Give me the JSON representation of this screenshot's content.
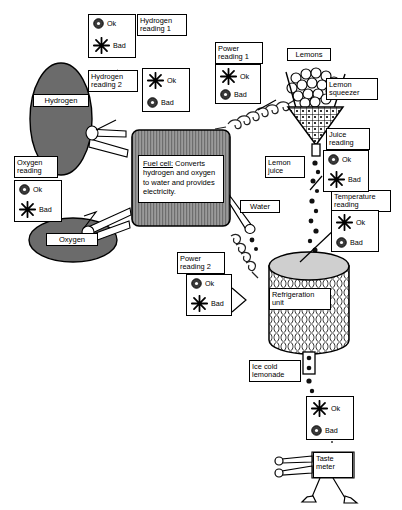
{
  "diagram": {
    "colors": {
      "gas_tank_fill": "#6b6b6b",
      "fuel_cell_fill": "#8c8c8c",
      "stroke": "#000000",
      "background": "#ffffff",
      "fridge_fill": "#cfcfcf"
    },
    "components": [
      {
        "id": "hydrogen-tank",
        "label": "Hydrogen",
        "kind": "ellipse-tank"
      },
      {
        "id": "oxygen-tank",
        "label": "Oxygen",
        "kind": "ellipse-tank"
      },
      {
        "id": "fuel-cell",
        "label": "Fuel cell:",
        "kind": "box"
      },
      {
        "id": "lemons",
        "label": "Lemons",
        "kind": "pile"
      },
      {
        "id": "lemon-squeezer",
        "label": "Lemon\nsqueezer",
        "kind": "funnel"
      },
      {
        "id": "lemon-juice",
        "label": "Lemon\njuice",
        "kind": "drip"
      },
      {
        "id": "water",
        "label": "Water",
        "kind": "pipe"
      },
      {
        "id": "refrigeration-unit",
        "label": "Refrigeration\nunit",
        "kind": "cylinder"
      },
      {
        "id": "ice-cold-lemonade",
        "label": "Ice cold\nlemonade",
        "kind": "drip"
      },
      {
        "id": "taste-meter",
        "label": "Taste\nmeter",
        "kind": "figure"
      }
    ],
    "fuel_cell": {
      "title": "Fuel cell:",
      "description": "Converts hydrogen and oxygen to water and provides electricity."
    },
    "gauges": [
      {
        "id": "hydrogen-reading-1",
        "title": "Hydrogen\nreading 1",
        "ok_symbol": "circle",
        "ok_label": "Ok",
        "bad_symbol": "starburst",
        "bad_label": "Bad",
        "top_symbol": "circle"
      },
      {
        "id": "hydrogen-reading-2",
        "title": "Hydrogen\nreading 2",
        "ok_symbol": "starburst",
        "ok_label": "Ok",
        "bad_symbol": "circle",
        "bad_label": "Bad",
        "top_symbol": "starburst"
      },
      {
        "id": "oxygen-reading",
        "title": "Oxygen\nreading",
        "ok_symbol": "circle",
        "ok_label": "Ok",
        "bad_symbol": "starburst",
        "bad_label": "Bad",
        "top_symbol": "circle"
      },
      {
        "id": "power-reading-1",
        "title": "Power\nreading  1",
        "ok_symbol": "starburst",
        "ok_label": "Ok",
        "bad_symbol": "circle",
        "bad_label": "Bad",
        "top_symbol": "starburst"
      },
      {
        "id": "power-reading-2",
        "title": "Power\nreading 2",
        "ok_symbol": "circle",
        "ok_label": "Ok",
        "bad_symbol": "starburst",
        "bad_label": "Bad",
        "top_symbol": "circle"
      },
      {
        "id": "juice-reading",
        "title": "Juice\nreading",
        "ok_symbol": "circle",
        "ok_label": "Ok",
        "bad_symbol": "starburst",
        "bad_label": "Bad",
        "top_symbol": "circle"
      },
      {
        "id": "temperature-reading",
        "title": "Temperature\nreading",
        "ok_symbol": "starburst",
        "ok_label": "Ok",
        "bad_symbol": "circle",
        "bad_label": "Bad",
        "top_symbol": "starburst"
      },
      {
        "id": "taste-reading",
        "title": "",
        "ok_symbol": "starburst",
        "ok_label": "Ok",
        "bad_symbol": "circle",
        "bad_label": "Bad",
        "top_symbol": "starburst"
      }
    ],
    "labels": {
      "hydrogen": "Hydrogen",
      "oxygen": "Oxygen",
      "lemons": "Lemons",
      "lemon_squeezer": "Lemon\nsqueezer",
      "lemon_juice": "Lemon\njuice",
      "water": "Water",
      "refrigeration_unit": "Refrigeration\nunit",
      "ice_cold_lemonade": "Ice cold\nlemonade",
      "taste_meter": "Taste\nmeter",
      "hydrogen_reading_1": "Hydrogen\nreading 1",
      "hydrogen_reading_2": "Hydrogen\nreading 2",
      "oxygen_reading": "Oxygen\nreading",
      "power_reading_1": "Power\nreading  1",
      "power_reading_2": "Power\nreading 2",
      "juice_reading": "Juice\nreading",
      "temperature_reading": "Temperature\nreading",
      "ok": "Ok",
      "bad": "Bad"
    }
  }
}
